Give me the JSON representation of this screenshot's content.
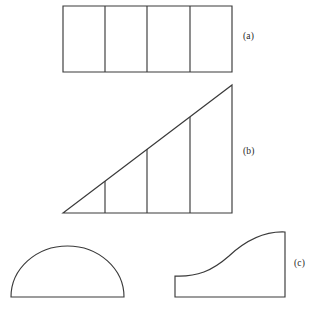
{
  "figure": {
    "background_color": "#ffffff",
    "stroke_color": "#3a3a3a",
    "label_color": "#272727",
    "width": 316,
    "height": 310,
    "labels": {
      "a": "(a)",
      "b": "(b)",
      "c": "(c)"
    },
    "panels": [
      {
        "id": "a",
        "label": "(a)",
        "shape": "rectangle-divided-into-four-vertical-strips",
        "outline": "M 63 6 L 232 6 L 232 72 L 63 72 Z",
        "dividers": [
          "M 105 6 L 105 72",
          "M 147 6 L 147 72",
          "M 190 6 L 190 72"
        ],
        "strip_count": 4
      },
      {
        "id": "b",
        "label": "(b)",
        "shape": "right-triangle-divided-into-four-vertical-strips",
        "outline": "M 63 213 L 232 85 L 232 213 Z",
        "dividers": [
          "M 105 181 L 105 213",
          "M 147 149 L 147 213",
          "M 190 117 L 190 213"
        ],
        "strip_count": 4
      },
      {
        "id": "c-left",
        "label": "",
        "shape": "semicircle-flat-side-down",
        "outline": "M 11 297 L 124 297 A 56.5 51 0 0 0 11 297 Z",
        "dividers": [],
        "strip_count": 0
      },
      {
        "id": "c",
        "label": "(c)",
        "shape": "region-under-s-shaped-curve",
        "outline": "M 175 276 L 175 297 L 285 297 L 285 232 C 262 231 243 243 229 256 C 212 271 197 277 175 276 Z",
        "dividers": [],
        "strip_count": 0
      }
    ]
  }
}
